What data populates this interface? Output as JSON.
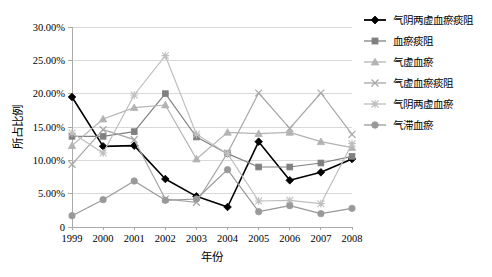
{
  "chart_data": {
    "type": "line",
    "title": "",
    "xlabel": "年份",
    "ylabel": "所占比例",
    "x": [
      "1999",
      "2000",
      "2001",
      "2002",
      "2003",
      "2004",
      "2005",
      "2006",
      "2007",
      "2008"
    ],
    "xtick_labels": [
      "1999",
      "2000",
      "2001",
      "2002",
      "2003",
      "2004",
      "2005",
      "2006",
      "2007",
      "2008"
    ],
    "ytick_labels": [
      "0",
      "5.00%",
      "10.00%",
      "15.00%",
      "20.00%",
      "25.00%",
      "30.00%"
    ],
    "ytick_values": [
      0,
      5,
      10,
      15,
      20,
      25,
      30
    ],
    "ylim": [
      0,
      30
    ],
    "grid": "horizontal",
    "legend_position": "right",
    "unit": "%",
    "series": [
      {
        "name": "气阴两虚血瘀痰阻",
        "marker": "diamond",
        "color": "#000000",
        "values": [
          19.5,
          12.1,
          12.2,
          7.2,
          4.6,
          3.0,
          12.8,
          7.0,
          8.2,
          10.2
        ]
      },
      {
        "name": "血瘀痰阻",
        "marker": "square",
        "color": "#808080",
        "values": [
          13.6,
          13.6,
          14.3,
          20.0,
          13.5,
          11.0,
          9.0,
          9.0,
          9.6,
          10.6
        ]
      },
      {
        "name": "气虚血瘀",
        "marker": "triangle",
        "color": "#b3b3b3",
        "values": [
          12.2,
          16.2,
          17.9,
          18.3,
          10.2,
          14.2,
          14.0,
          14.2,
          12.8,
          11.9
        ]
      },
      {
        "name": "气虚血瘀痰阻",
        "marker": "cross",
        "color": "#a6a6a6",
        "values": [
          9.4,
          14.6,
          13.1,
          4.2,
          3.7,
          11.1,
          20.1,
          14.8,
          20.1,
          13.9
        ]
      },
      {
        "name": "气阴两虚血瘀",
        "marker": "star",
        "color": "#bfbfbf",
        "values": [
          14.1,
          11.1,
          19.8,
          25.7,
          13.9,
          11.0,
          3.9,
          4.0,
          3.5,
          12.5
        ]
      },
      {
        "name": "气滞血瘀",
        "marker": "circle",
        "color": "#999999",
        "values": [
          1.7,
          4.1,
          6.9,
          4.0,
          4.2,
          8.6,
          2.3,
          3.2,
          2.0,
          2.8
        ]
      }
    ]
  },
  "legend": {
    "items": [
      {
        "label": "气阴两虚血瘀痰阻"
      },
      {
        "label": "血瘀痰阻"
      },
      {
        "label": "气虚血瘀"
      },
      {
        "label": "气虚血瘀痰阻"
      },
      {
        "label": "气阴两虚血瘀"
      },
      {
        "label": "气滞血瘀"
      }
    ]
  }
}
